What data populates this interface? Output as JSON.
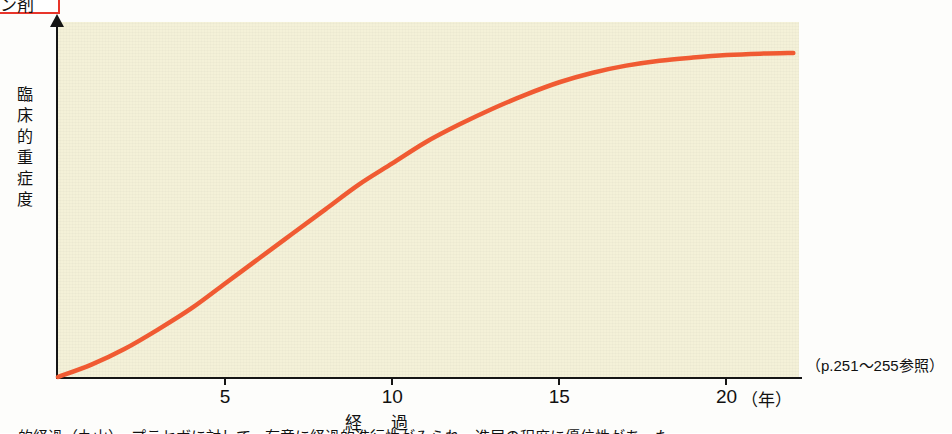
{
  "figure": {
    "tag_text": "ン剤",
    "reference_note": "（p.251〜255参照）",
    "bottom_caption": "的経過（丸山）．プラセボに対して，有意に経過的進行性がみられ，進展の程度に優位性があった．"
  },
  "chart_data": {
    "type": "line",
    "title": "",
    "xlabel": "経　過",
    "ylabel": "臨床的重症度",
    "x_unit": "（年）",
    "xlim": [
      0,
      22.2
    ],
    "ylim": [
      0,
      1
    ],
    "grid": false,
    "legend": "none",
    "xticks": [
      5,
      10,
      15,
      20
    ],
    "xtick_labels": [
      "5",
      "10",
      "15",
      "20"
    ],
    "yticks": [],
    "ytick_labels": [],
    "series": [
      {
        "name": "臨床的重症度の経時変化",
        "color": "#f05a32",
        "x": [
          0,
          1,
          2,
          3,
          4,
          5,
          6,
          7,
          8,
          9,
          10,
          11,
          12,
          13,
          14,
          15,
          16,
          17,
          18,
          19,
          20,
          21,
          22
        ],
        "y": [
          0.0,
          0.035,
          0.08,
          0.135,
          0.195,
          0.265,
          0.335,
          0.405,
          0.475,
          0.545,
          0.605,
          0.665,
          0.715,
          0.76,
          0.8,
          0.835,
          0.862,
          0.882,
          0.896,
          0.905,
          0.912,
          0.916,
          0.918
        ]
      }
    ]
  },
  "axis_labels": {
    "y_chars": [
      "臨",
      "床",
      "的",
      "重",
      "症",
      "度"
    ]
  }
}
